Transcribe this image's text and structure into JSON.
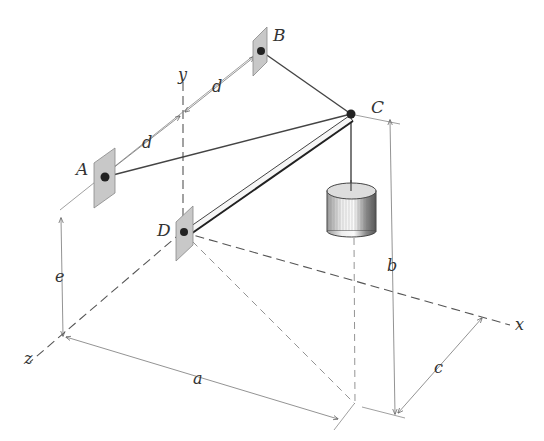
{
  "figure": {
    "points": {
      "A": "A",
      "B": "B",
      "C": "C",
      "D": "D"
    },
    "axes": {
      "x": "x",
      "y": "y",
      "z": "z"
    },
    "dimensions": {
      "a": "a",
      "b": "b",
      "c": "c",
      "d_upper": "d",
      "d_lower": "d",
      "e": "e"
    },
    "colors": {
      "line": "#444444",
      "plate": "#c8c8c8",
      "background": "#ffffff"
    }
  }
}
